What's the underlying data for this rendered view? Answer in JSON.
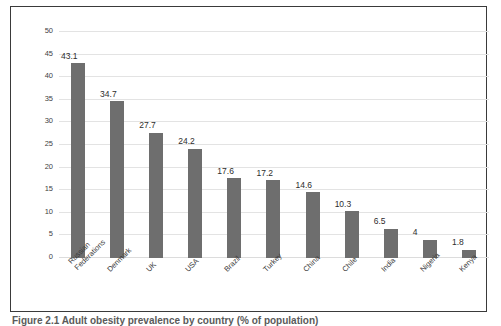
{
  "caption": "Figure 2.1 Adult obesity prevalence by country (% of population)",
  "colors": {
    "bar": "#6e6e6e",
    "gridline": "#e3e3e3",
    "frame": "#3a3a3a",
    "axis_text": "#3f3f3f",
    "value_text": "#2d2d2d"
  },
  "chart_data": {
    "type": "bar",
    "title": "",
    "xlabel": "",
    "ylabel": "",
    "ylim": [
      0,
      50
    ],
    "yticks": [
      0,
      5,
      10,
      15,
      20,
      25,
      30,
      35,
      40,
      45,
      50
    ],
    "grid": true,
    "legend": "none",
    "orientation": "vertical",
    "categories": [
      "Russian\nFederations",
      "Denmark",
      "UK",
      "USA",
      "Brazil",
      "Turkey",
      "China",
      "Chile",
      "India",
      "Nigeria",
      "Kenya"
    ],
    "values": [
      43.1,
      34.7,
      27.7,
      24.2,
      17.6,
      17.2,
      14.6,
      10.3,
      6.5,
      4,
      1.8
    ],
    "value_labels": [
      "43.1",
      "34.7",
      "27.7",
      "24.2",
      "17.6",
      "17.2",
      "14.6",
      "10.3",
      "6.5",
      "4",
      "1.8"
    ]
  }
}
